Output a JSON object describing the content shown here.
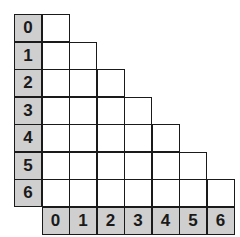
{
  "grid": {
    "size": 7,
    "row_labels": [
      "0",
      "1",
      "2",
      "3",
      "4",
      "5",
      "6"
    ],
    "col_labels": [
      "0",
      "1",
      "2",
      "3",
      "4",
      "5",
      "6"
    ],
    "layout": "lower-triangular",
    "header_color": "#cfcfcf",
    "cell_color": "#ffffff",
    "line_color": "#1a1a1a"
  }
}
